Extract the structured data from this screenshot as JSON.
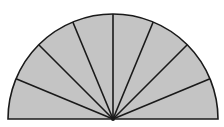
{
  "diagram": {
    "shape": "semicircle",
    "sectors": 8,
    "fill_color": "#c4c4c4",
    "stroke_color": "#1a1a1a",
    "background": "#ffffff",
    "center": [
      113,
      119
    ],
    "radius": 105
  }
}
